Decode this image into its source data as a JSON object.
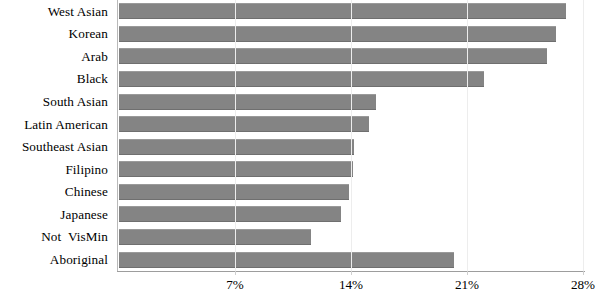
{
  "chart": {
    "type": "bar",
    "orientation": "horizontal",
    "title": "",
    "xlabel": "",
    "ylabel": "",
    "bar_color": "#848484",
    "grid": true
  },
  "chart_data": {
    "type": "bar",
    "orientation": "horizontal",
    "title": "",
    "subtitle": "",
    "xlabel": "",
    "ylabel": "",
    "categories": [
      "West Asian",
      "Korean",
      "Arab",
      "Black",
      "South Asian",
      "Latin American",
      "Southeast Asian",
      "Filipino",
      "Chinese",
      "Japanese",
      "Not  VisMin",
      "Aboriginal"
    ],
    "values": [
      27.0,
      26.4,
      25.8,
      22.0,
      15.5,
      15.1,
      14.2,
      14.1,
      13.9,
      13.4,
      11.6,
      20.2
    ],
    "value_unit": "%",
    "xlim": [
      0,
      29
    ],
    "xticks": [
      7,
      14,
      21,
      28
    ],
    "xtick_labels": [
      "7%",
      "14%",
      "21%",
      "28%"
    ],
    "grid": true,
    "legend": null,
    "series": [
      {
        "name": "",
        "values": [
          27.0,
          26.4,
          25.8,
          22.0,
          15.5,
          15.1,
          14.2,
          14.1,
          13.9,
          13.4,
          11.6,
          20.2
        ]
      }
    ]
  }
}
